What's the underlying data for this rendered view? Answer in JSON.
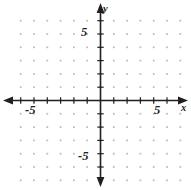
{
  "figure": {
    "kind": "cartesian-coordinate-plane",
    "width": 191,
    "height": 190,
    "background_color": "#ffffff",
    "ink_color": "#231f20",
    "grid_dot_color": "#bfbcc4"
  },
  "chart_data": {
    "type": "scatter",
    "title": "",
    "subtitle": "",
    "xlabel": "x",
    "ylabel": "y",
    "xlim": [
      -6,
      6
    ],
    "ylim": [
      -6,
      6
    ],
    "x": [],
    "y": [],
    "series": [],
    "annotations": [],
    "grid": true,
    "grid_style": "dotted-lattice",
    "grid_spacing": 1,
    "legend": false,
    "legend_position": "none",
    "axes": {
      "x_axis": {
        "label": "x",
        "tick_interval": 1,
        "tick_values": [
          -6,
          -5,
          -4,
          -3,
          -2,
          -1,
          1,
          2,
          3,
          4,
          5,
          6
        ],
        "labeled_ticks": [
          {
            "value": -5,
            "text": "-5"
          },
          {
            "value": 5,
            "text": "5"
          }
        ],
        "arrows": [
          "left",
          "right"
        ]
      },
      "y_axis": {
        "label": "y",
        "tick_interval": 1,
        "tick_values": [
          -6,
          -5,
          -4,
          -3,
          -2,
          -1,
          1,
          2,
          3,
          4,
          5,
          6
        ],
        "labeled_ticks": [
          {
            "value": 5,
            "text": "5"
          },
          {
            "value": -5,
            "text": "-5"
          }
        ],
        "arrows": [
          "up",
          "down"
        ]
      }
    }
  },
  "labels": {
    "x_axis_name": "x",
    "y_axis_name": "y",
    "x_positive_tick": "5",
    "x_negative_tick": "-5",
    "y_positive_tick": "5",
    "y_negative_tick": "-5"
  }
}
